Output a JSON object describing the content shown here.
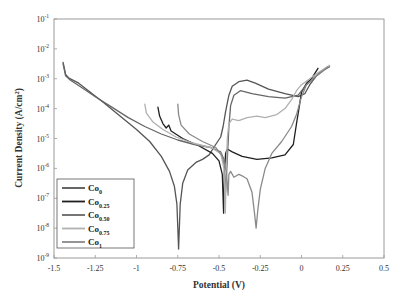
{
  "chart_data": {
    "type": "line",
    "title": "",
    "xlabel": "Potential (V)",
    "ylabel": "Current Density (A/cm2)",
    "ylabel_base": "Current Density (A/cm",
    "ylabel_sup": "2",
    "ylabel_tail": ")",
    "xlim": [
      -1.5,
      0.5
    ],
    "ylim": [
      1e-09,
      0.1
    ],
    "yscale": "log",
    "grid": false,
    "legend_position": "lower left",
    "x_ticks": [
      -1.5,
      -1.25,
      -1,
      -0.75,
      -0.5,
      -0.25,
      0,
      0.25,
      0.5
    ],
    "x_tick_labels": [
      "-1.5",
      "-1.25",
      "-1",
      "-0.75",
      "-0.5",
      "-0.25",
      "0",
      "0.25",
      "0.5"
    ],
    "y_ticks_exp": [
      -1,
      -2,
      -3,
      -4,
      -5,
      -6,
      -7,
      -8,
      -9
    ],
    "y_tick_base": "10",
    "series": [
      {
        "name": "Co0",
        "label_main": "Co",
        "label_sub": "0",
        "color": "#555555",
        "points": [
          [
            -1.445,
            -2.45
          ],
          [
            -1.43,
            -2.85
          ],
          [
            -1.41,
            -2.98
          ],
          [
            -1.35,
            -3.15
          ],
          [
            -1.28,
            -3.45
          ],
          [
            -1.2,
            -3.8
          ],
          [
            -1.1,
            -4.25
          ],
          [
            -1.0,
            -4.7
          ],
          [
            -0.92,
            -5.1
          ],
          [
            -0.85,
            -5.6
          ],
          [
            -0.8,
            -6.1
          ],
          [
            -0.77,
            -6.6
          ],
          [
            -0.755,
            -7.2
          ],
          [
            -0.745,
            -8.7
          ],
          [
            -0.735,
            -7.2
          ],
          [
            -0.72,
            -6.5
          ],
          [
            -0.69,
            -6.05
          ],
          [
            -0.64,
            -5.8
          ],
          [
            -0.6,
            -5.7
          ],
          [
            -0.56,
            -5.55
          ],
          [
            -0.52,
            -5.2
          ],
          [
            -0.49,
            -4.95
          ],
          [
            -0.475,
            -4.6
          ],
          [
            -0.46,
            -4.1
          ],
          [
            -0.44,
            -3.55
          ],
          [
            -0.42,
            -3.25
          ],
          [
            -0.38,
            -3.1
          ],
          [
            -0.33,
            -3.05
          ],
          [
            -0.28,
            -3.15
          ],
          [
            -0.2,
            -3.35
          ],
          [
            -0.1,
            -3.5
          ],
          [
            -0.02,
            -3.6
          ],
          [
            0.02,
            -3.5
          ],
          [
            0.05,
            -3.2
          ],
          [
            0.09,
            -2.9
          ],
          [
            0.12,
            -2.75
          ]
        ]
      },
      {
        "name": "Co0.25",
        "label_main": "Co",
        "label_sub": "0.25",
        "color": "#1f1f1f",
        "points": [
          [
            -0.87,
            -3.95
          ],
          [
            -0.86,
            -4.25
          ],
          [
            -0.84,
            -4.5
          ],
          [
            -0.82,
            -4.65
          ],
          [
            -0.805,
            -4.55
          ],
          [
            -0.79,
            -4.75
          ],
          [
            -0.72,
            -5.0
          ],
          [
            -0.62,
            -5.25
          ],
          [
            -0.54,
            -5.5
          ],
          [
            -0.5,
            -5.75
          ],
          [
            -0.48,
            -6.2
          ],
          [
            -0.472,
            -7.5
          ],
          [
            -0.468,
            -6.2
          ],
          [
            -0.46,
            -5.5
          ],
          [
            -0.45,
            -5.35
          ],
          [
            -0.42,
            -5.45
          ],
          [
            -0.36,
            -5.6
          ],
          [
            -0.27,
            -5.7
          ],
          [
            -0.18,
            -5.65
          ],
          [
            -0.1,
            -5.55
          ],
          [
            -0.05,
            -5.2
          ],
          [
            -0.03,
            -4.5
          ],
          [
            -0.01,
            -3.8
          ],
          [
            0.0,
            -3.45
          ],
          [
            0.03,
            -3.15
          ],
          [
            0.06,
            -3.0
          ],
          [
            0.1,
            -2.65
          ]
        ]
      },
      {
        "name": "Co0.50",
        "label_main": "Co",
        "label_sub": "0.50",
        "color": "#666666",
        "points": [
          [
            -1.445,
            -2.5
          ],
          [
            -1.43,
            -2.9
          ],
          [
            -1.4,
            -3.05
          ],
          [
            -1.33,
            -3.3
          ],
          [
            -1.25,
            -3.6
          ],
          [
            -1.15,
            -3.95
          ],
          [
            -1.05,
            -4.3
          ],
          [
            -0.95,
            -4.6
          ],
          [
            -0.85,
            -4.85
          ],
          [
            -0.75,
            -5.05
          ],
          [
            -0.65,
            -5.2
          ],
          [
            -0.55,
            -5.3
          ],
          [
            -0.49,
            -5.45
          ],
          [
            -0.47,
            -5.7
          ],
          [
            -0.46,
            -6.8
          ],
          [
            -0.45,
            -5.7
          ],
          [
            -0.44,
            -4.6
          ],
          [
            -0.43,
            -3.9
          ],
          [
            -0.41,
            -3.55
          ],
          [
            -0.37,
            -3.4
          ],
          [
            -0.3,
            -3.5
          ],
          [
            -0.2,
            -3.6
          ],
          [
            -0.1,
            -3.65
          ],
          [
            -0.02,
            -3.55
          ],
          [
            0.03,
            -3.2
          ],
          [
            0.08,
            -2.95
          ],
          [
            0.14,
            -2.7
          ],
          [
            0.17,
            -2.6
          ]
        ]
      },
      {
        "name": "Co0.75",
        "label_main": "Co",
        "label_sub": "0.75",
        "color": "#b0b0b0",
        "points": [
          [
            -0.95,
            -3.85
          ],
          [
            -0.94,
            -4.15
          ],
          [
            -0.9,
            -4.45
          ],
          [
            -0.84,
            -4.7
          ],
          [
            -0.76,
            -4.95
          ],
          [
            -0.66,
            -5.15
          ],
          [
            -0.55,
            -5.3
          ],
          [
            -0.49,
            -5.5
          ],
          [
            -0.47,
            -6.0
          ],
          [
            -0.462,
            -7.5
          ],
          [
            -0.455,
            -6.0
          ],
          [
            -0.45,
            -5.0
          ],
          [
            -0.44,
            -4.5
          ],
          [
            -0.42,
            -4.35
          ],
          [
            -0.38,
            -4.4
          ],
          [
            -0.33,
            -4.3
          ],
          [
            -0.27,
            -4.25
          ],
          [
            -0.22,
            -4.3
          ],
          [
            -0.15,
            -4.2
          ],
          [
            -0.1,
            -4.0
          ],
          [
            -0.06,
            -3.7
          ],
          [
            -0.03,
            -3.4
          ],
          [
            0.0,
            -3.2
          ],
          [
            0.05,
            -3.0
          ],
          [
            0.1,
            -2.8
          ],
          [
            0.17,
            -2.55
          ]
        ]
      },
      {
        "name": "Co1",
        "label_main": "Co",
        "label_sub": "1",
        "color": "#8a8a8a",
        "points": [
          [
            -0.75,
            -3.85
          ],
          [
            -0.745,
            -4.2
          ],
          [
            -0.73,
            -4.55
          ],
          [
            -0.68,
            -4.85
          ],
          [
            -0.6,
            -5.1
          ],
          [
            -0.52,
            -5.3
          ],
          [
            -0.48,
            -5.6
          ],
          [
            -0.455,
            -6.1
          ],
          [
            -0.445,
            -6.9
          ],
          [
            -0.44,
            -6.2
          ],
          [
            -0.43,
            -6.1
          ],
          [
            -0.41,
            -6.3
          ],
          [
            -0.38,
            -6.2
          ],
          [
            -0.36,
            -6.25
          ],
          [
            -0.33,
            -6.35
          ],
          [
            -0.3,
            -6.8
          ],
          [
            -0.285,
            -7.5
          ],
          [
            -0.275,
            -8.0
          ],
          [
            -0.265,
            -7.4
          ],
          [
            -0.25,
            -6.7
          ],
          [
            -0.22,
            -6.0
          ],
          [
            -0.18,
            -5.5
          ],
          [
            -0.12,
            -5.1
          ],
          [
            -0.06,
            -4.6
          ],
          [
            -0.03,
            -4.2
          ],
          [
            0.0,
            -3.6
          ],
          [
            0.03,
            -3.2
          ],
          [
            0.08,
            -2.95
          ],
          [
            0.16,
            -2.6
          ]
        ]
      }
    ]
  }
}
